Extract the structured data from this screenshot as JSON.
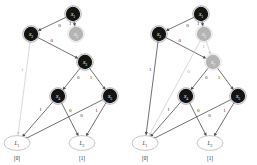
{
  "figure": {
    "type": "binary-decision-diagram-pair",
    "colors": {
      "node_active": "#141414",
      "node_dimmed": "#b4b4b4",
      "terminal_fill": "#ffffff",
      "terminal_stroke": "#b9b9b9",
      "edge": "#4d4d4d",
      "edge_dimmed": "#cfcfcf",
      "label_text": "#2b2b2b",
      "node_text": "#ffffff",
      "background": "#ffffff"
    }
  },
  "panels": [
    {
      "id": "left",
      "nodes": [
        {
          "id": "x1",
          "label": "x",
          "sub": "1",
          "state": "active"
        },
        {
          "id": "x2",
          "label": "x",
          "sub": "2",
          "state": "active"
        },
        {
          "id": "x2b",
          "label": "x",
          "sub": "2",
          "state": "dimmed"
        },
        {
          "id": "x3",
          "label": "x",
          "sub": "3",
          "state": "active"
        },
        {
          "id": "x4",
          "label": "x",
          "sub": "4",
          "state": "active"
        },
        {
          "id": "x5",
          "label": "x",
          "sub": "5",
          "state": "active"
        }
      ],
      "terminals": [
        {
          "id": "L1",
          "label": "L",
          "sub": "1",
          "caption": "[0]"
        },
        {
          "id": "L2",
          "label": "L",
          "sub": "2",
          "caption": "[1]"
        }
      ],
      "edges": [
        {
          "from": "x1",
          "to": "x2",
          "label": "0",
          "state": "active"
        },
        {
          "from": "x1",
          "to": "x2b",
          "label": "1",
          "state": "active"
        },
        {
          "from": "x2",
          "to": "x3",
          "label": "0",
          "state": "active"
        },
        {
          "from": "x2",
          "to": "L1",
          "label": "1",
          "state": "dimmed"
        },
        {
          "from": "x3",
          "to": "x4",
          "label": "0",
          "state": "active"
        },
        {
          "from": "x3",
          "to": "x5",
          "label": "1",
          "state": "active"
        },
        {
          "from": "x4",
          "to": "L1",
          "label": "1",
          "state": "active"
        },
        {
          "from": "x4",
          "to": "L2",
          "label": "0",
          "state": "active"
        },
        {
          "from": "x5",
          "to": "L1",
          "label": "0",
          "state": "active"
        },
        {
          "from": "x5",
          "to": "L2",
          "label": "1",
          "state": "active"
        }
      ]
    },
    {
      "id": "right",
      "nodes": [
        {
          "id": "x1",
          "label": "x",
          "sub": "1",
          "state": "active"
        },
        {
          "id": "x2",
          "label": "x",
          "sub": "2",
          "state": "active"
        },
        {
          "id": "x2b",
          "label": "x",
          "sub": "2",
          "state": "dimmed"
        },
        {
          "id": "x3",
          "label": "x",
          "sub": "3",
          "state": "dimmed"
        },
        {
          "id": "x4",
          "label": "x",
          "sub": "4",
          "state": "active"
        },
        {
          "id": "x5",
          "label": "x",
          "sub": "5",
          "state": "active"
        }
      ],
      "terminals": [
        {
          "id": "L1",
          "label": "L",
          "sub": "1",
          "caption": "[0]"
        },
        {
          "id": "L2",
          "label": "L",
          "sub": "2",
          "caption": "[1]"
        }
      ],
      "edges": [
        {
          "from": "x1",
          "to": "x2",
          "label": "0",
          "state": "active"
        },
        {
          "from": "x1",
          "to": "x2b",
          "label": "1",
          "state": "active"
        },
        {
          "from": "x2",
          "to": "x3",
          "label": "0",
          "state": "active"
        },
        {
          "from": "x2",
          "to": "L1",
          "label": "1",
          "state": "active"
        },
        {
          "from": "x2b",
          "to": "L1",
          "label": "0",
          "state": "dimmed"
        },
        {
          "from": "x2b",
          "to": "x3",
          "label": "1",
          "state": "dimmed"
        },
        {
          "from": "x3",
          "to": "x4",
          "label": "0",
          "state": "active"
        },
        {
          "from": "x3",
          "to": "x5",
          "label": "1",
          "state": "active"
        },
        {
          "from": "x4",
          "to": "L1",
          "label": "1",
          "state": "active"
        },
        {
          "from": "x4",
          "to": "L2",
          "label": "0",
          "state": "active"
        },
        {
          "from": "x5",
          "to": "L1",
          "label": "0",
          "state": "active"
        },
        {
          "from": "x5",
          "to": "L2",
          "label": "1",
          "state": "active"
        }
      ]
    }
  ],
  "captions": {
    "left_zero": "[0]",
    "left_one": "[1]",
    "right_zero": "[0]",
    "right_one": "[1]"
  }
}
